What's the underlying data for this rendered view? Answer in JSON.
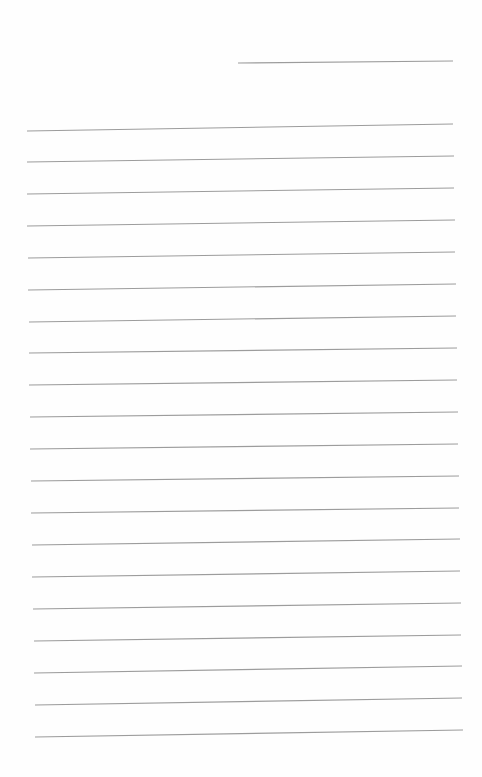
{
  "page": {
    "type": "lined-paper",
    "background_color": "#fefefe",
    "line_color": "#9c9c9c"
  },
  "header_line": {
    "x1": 238,
    "y1": 63,
    "x2": 453,
    "y2": 61
  },
  "ruled_lines": [
    {
      "x1": 27,
      "y1": 131,
      "x2": 453,
      "y2": 124
    },
    {
      "x1": 27,
      "y1": 162,
      "x2": 454,
      "y2": 156
    },
    {
      "x1": 27,
      "y1": 194,
      "x2": 454,
      "y2": 188
    },
    {
      "x1": 27,
      "y1": 226,
      "x2": 455,
      "y2": 220
    },
    {
      "x1": 28,
      "y1": 258,
      "x2": 455,
      "y2": 252
    },
    {
      "x1": 28,
      "y1": 290,
      "x2": 456,
      "y2": 284
    },
    {
      "x1": 29,
      "y1": 322,
      "x2": 456,
      "y2": 316
    },
    {
      "x1": 29,
      "y1": 353,
      "x2": 457,
      "y2": 348
    },
    {
      "x1": 29,
      "y1": 385,
      "x2": 457,
      "y2": 380
    },
    {
      "x1": 30,
      "y1": 417,
      "x2": 458,
      "y2": 412
    },
    {
      "x1": 30,
      "y1": 449,
      "x2": 458,
      "y2": 444
    },
    {
      "x1": 31,
      "y1": 481,
      "x2": 459,
      "y2": 476
    },
    {
      "x1": 31,
      "y1": 513,
      "x2": 459,
      "y2": 508
    },
    {
      "x1": 32,
      "y1": 545,
      "x2": 460,
      "y2": 539
    },
    {
      "x1": 32,
      "y1": 577,
      "x2": 460,
      "y2": 571
    },
    {
      "x1": 33,
      "y1": 609,
      "x2": 461,
      "y2": 603
    },
    {
      "x1": 34,
      "y1": 641,
      "x2": 461,
      "y2": 635
    },
    {
      "x1": 34,
      "y1": 673,
      "x2": 462,
      "y2": 666
    },
    {
      "x1": 35,
      "y1": 705,
      "x2": 462,
      "y2": 698
    },
    {
      "x1": 35,
      "y1": 737,
      "x2": 463,
      "y2": 730
    }
  ]
}
